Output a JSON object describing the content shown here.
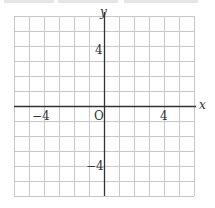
{
  "chart_data": {
    "type": "coordinate-grid",
    "title": "",
    "xlabel": "x",
    "ylabel": "y",
    "xlim": [
      -6,
      6
    ],
    "ylim": [
      -6,
      6
    ],
    "grid": true,
    "grid_step": 1,
    "origin_label": "O",
    "x_tick_labels": [
      {
        "value": -4,
        "label": "−4"
      },
      {
        "value": 4,
        "label": "4"
      }
    ],
    "y_tick_labels": [
      {
        "value": 4,
        "label": "4"
      },
      {
        "value": -4,
        "label": "−4"
      }
    ],
    "series": []
  },
  "labels": {
    "x_axis": "x",
    "y_axis": "y",
    "origin": "O",
    "x_neg4": "−4",
    "x_pos4": "4",
    "y_pos4": "4",
    "y_neg4": "−4"
  },
  "colors": {
    "grid": "#c8c8c8",
    "axis": "#333333",
    "text": "#333333"
  }
}
